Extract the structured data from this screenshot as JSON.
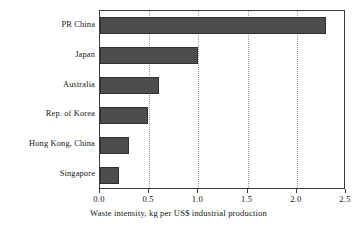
{
  "chart_data": {
    "type": "bar",
    "orientation": "horizontal",
    "title": "",
    "xlabel": "Waste intensity, kg per US$ industrial production",
    "ylabel": "",
    "xlim": [
      0.0,
      2.5
    ],
    "xticks": [
      "0.0",
      "0.5",
      "1.0",
      "1.5",
      "2.0",
      "2.5"
    ],
    "xtick_values": [
      0.0,
      0.5,
      1.0,
      1.5,
      2.0,
      2.5
    ],
    "grid": "vertical-dotted",
    "legend": "none",
    "bar_color": "#4d4d4d",
    "categories": [
      "PR China",
      "Japan",
      "Australia",
      "Rep. of Korea",
      "Hong Kong, China",
      "Singapore"
    ],
    "values": [
      2.3,
      1.0,
      0.6,
      0.49,
      0.29,
      0.19
    ]
  },
  "colors": {
    "bar_fill": "#4d4d4d",
    "bar_edge": "#303030",
    "axis": "#3a3a3a",
    "gridline": "#9a9a9a",
    "background": "#ffffff",
    "text": "#151515"
  }
}
